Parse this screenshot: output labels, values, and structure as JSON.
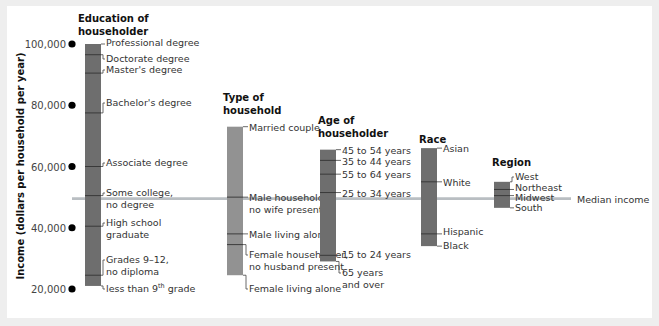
{
  "chart_data": {
    "type": "bar",
    "subtype": "floating-range-bars",
    "ylabel": "Income (dollars per household per year)",
    "ylim": [
      20000,
      100000
    ],
    "yticks": [
      100000,
      80000,
      60000,
      40000,
      20000
    ],
    "ytick_labels": [
      "100,000",
      "80,000",
      "60,000",
      "40,000",
      "20,000"
    ],
    "median_income": {
      "label": "Median income",
      "value": 49500
    },
    "groups": [
      {
        "title": [
          "Education of",
          "householder"
        ],
        "color": "#6e6e6e",
        "items": [
          {
            "label": [
              "Professional degree"
            ],
            "value": 100000
          },
          {
            "label": [
              "Doctorate degree"
            ],
            "value": 96500
          },
          {
            "label": [
              "Master's degree"
            ],
            "value": 90500
          },
          {
            "label": [
              "Bachelor's degree"
            ],
            "value": 77500
          },
          {
            "label": [
              "Associate degree"
            ],
            "value": 60000
          },
          {
            "label": [
              "Some college,",
              "no degree"
            ],
            "value": 50500
          },
          {
            "label": [
              "High school",
              "graduate"
            ],
            "value": 40500
          },
          {
            "label": [
              "Grades 9–12,",
              "no diploma"
            ],
            "value": 24500
          },
          {
            "label": [
              "less than 9th grade"
            ],
            "value": 21000
          }
        ]
      },
      {
        "title": [
          "Type of",
          "household"
        ],
        "color": "#929292",
        "items": [
          {
            "label": [
              "Married couple"
            ],
            "value": 73000
          },
          {
            "label": [
              "Male householder,",
              "no wife present"
            ],
            "value": 50000
          },
          {
            "label": [
              "Male living alone"
            ],
            "value": 38000
          },
          {
            "label": [
              "Female householder,",
              "no husband present"
            ],
            "value": 34500
          },
          {
            "label": [
              "Female living alone"
            ],
            "value": 24500
          }
        ]
      },
      {
        "title": [
          "Age of",
          "householder"
        ],
        "color": "#6e6e6e",
        "items": [
          {
            "label": [
              "45 to 54 years"
            ],
            "value": 65500
          },
          {
            "label": [
              "35 to 44 years"
            ],
            "value": 62000
          },
          {
            "label": [
              "55 to 64 years"
            ],
            "value": 57500
          },
          {
            "label": [
              "25 to 34 years"
            ],
            "value": 51500
          },
          {
            "label": [
              "15 to 24 years"
            ],
            "value": 31000
          },
          {
            "label": [
              "65 years",
              "and over"
            ],
            "value": 29000
          }
        ]
      },
      {
        "title": [
          "Race"
        ],
        "color": "#6e6e6e",
        "items": [
          {
            "label": [
              "Asian"
            ],
            "value": 66000
          },
          {
            "label": [
              "White"
            ],
            "value": 55000
          },
          {
            "label": [
              "Hispanic"
            ],
            "value": 38000
          },
          {
            "label": [
              "Black"
            ],
            "value": 34000
          }
        ]
      },
      {
        "title": [
          "Region"
        ],
        "color": "#6e6e6e",
        "items": [
          {
            "label": [
              "West"
            ],
            "value": 55000
          },
          {
            "label": [
              "Northeast"
            ],
            "value": 52500
          },
          {
            "label": [
              "Midwest"
            ],
            "value": 50500
          },
          {
            "label": [
              "South"
            ],
            "value": 46500
          }
        ]
      }
    ],
    "grid": false,
    "legend": null
  }
}
